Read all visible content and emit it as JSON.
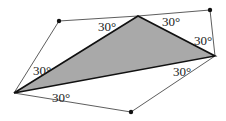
{
  "diagram": {
    "shaded_fill": "#a9a9a9",
    "angle_labels": {
      "left_upper": "30°",
      "left_lower": "30°",
      "top_left": "30°",
      "top_right": "30°",
      "right_upper": "30°",
      "right_lower": "30°"
    }
  }
}
